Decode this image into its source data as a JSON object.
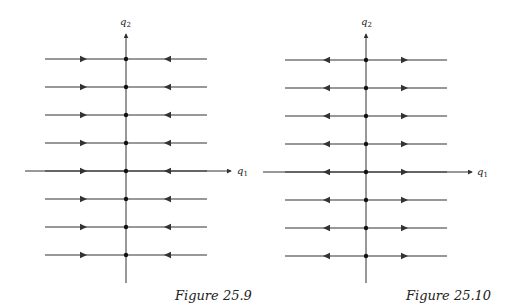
{
  "figures": [
    {
      "id": "fig-25-9",
      "caption": "Figure 25.9",
      "x_axis_label": "q",
      "x_axis_sub": "1",
      "y_axis_label": "q",
      "y_axis_sub": "2",
      "flow": "toward-axis",
      "row_count": 8,
      "description": "Horizontal trajectories with arrows pointing toward the q2 axis; each row has a fixed point on the q2 axis"
    },
    {
      "id": "fig-25-10",
      "caption": "Figure 25.10",
      "x_axis_label": "q",
      "x_axis_sub": "1",
      "y_axis_label": "q",
      "y_axis_sub": "2",
      "flow": "away-from-axis",
      "row_count": 8,
      "description": "Horizontal trajectories with arrows pointing away from the q2 axis; each row has a fixed point on the q2 axis"
    }
  ],
  "colors": {
    "line": "#333333",
    "text": "#222222",
    "background": "#ffffff"
  }
}
